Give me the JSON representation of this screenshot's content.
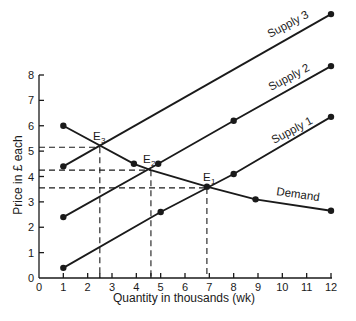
{
  "chart_data": {
    "type": "line",
    "title": "",
    "xlabel": "Quantity in thousands (wk)",
    "ylabel": "Price in £ each",
    "xlim": [
      0,
      12
    ],
    "ylim": [
      0,
      8
    ],
    "x_ticks": [
      0,
      1,
      2,
      3,
      4,
      5,
      6,
      7,
      8,
      9,
      10,
      11,
      12
    ],
    "y_ticks": [
      0,
      1,
      2,
      3,
      4,
      5,
      6,
      7,
      8
    ],
    "grid": false,
    "legend": "inline labels",
    "series": [
      {
        "name": "Supply 1",
        "points": [
          [
            1,
            0.4
          ],
          [
            5,
            2.6
          ],
          [
            8,
            4.1
          ],
          [
            12,
            6.35
          ]
        ]
      },
      {
        "name": "Supply 2",
        "points": [
          [
            1,
            2.4
          ],
          [
            4.9,
            4.5
          ],
          [
            8,
            6.2
          ],
          [
            12,
            8.35
          ]
        ]
      },
      {
        "name": "Supply 3",
        "points": [
          [
            1,
            4.4
          ],
          [
            12,
            10.4
          ]
        ]
      },
      {
        "name": "Demand",
        "points": [
          [
            1,
            6.0
          ],
          [
            3.9,
            4.5
          ],
          [
            4.6,
            4.25
          ],
          [
            6.9,
            3.6
          ],
          [
            8.9,
            3.1
          ],
          [
            12,
            2.65
          ]
        ]
      }
    ],
    "annotations": [
      {
        "label": "E1",
        "x": 6.9,
        "y": 3.55
      },
      {
        "label": "E2",
        "x": 4.6,
        "y": 4.25
      },
      {
        "label": "E3",
        "x": 2.5,
        "y": 5.15
      }
    ],
    "x_minor_ticks": [
      2.5,
      4.6
    ],
    "equilibrium_dashed_lines": [
      {
        "x": 2.5,
        "y": 5.15
      },
      {
        "x": 4.6,
        "y": 4.25
      },
      {
        "x": 6.9,
        "y": 3.55
      }
    ]
  },
  "labels": {
    "xlabel": "Quantity in thousands (wk)",
    "ylabel": "Price in £ each",
    "supply1": "Supply 1",
    "supply2": "Supply 2",
    "supply3": "Supply 3",
    "demand": "Demand",
    "e1": "E",
    "e1sub": "1",
    "e2": "E",
    "e2sub": "2",
    "e3": "E",
    "e3sub": "3"
  }
}
